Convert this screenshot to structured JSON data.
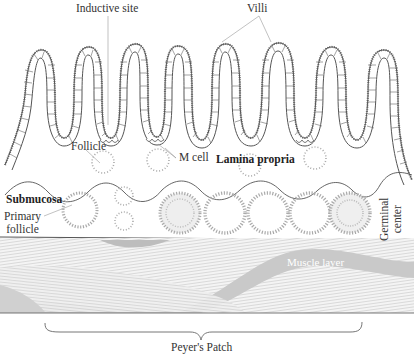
{
  "figure": {
    "title": "Peyer's Patch",
    "labels": {
      "inductive_site": "Inductive site",
      "villi": "Villi",
      "follicle": "Follicle",
      "m_cell": "M cell",
      "lamina_propria": "Lamina propria",
      "submucosa": "Submucosa",
      "primary_follicle_line1": "Primary",
      "primary_follicle_line2": "follicle",
      "germinal_center_line1": "Germinal",
      "germinal_center_line2": "center",
      "muscle_layer": "Muscle layer",
      "peyers_patch": "Peyer's Patch"
    },
    "colors": {
      "outline": "#555555",
      "cell_fill": "#ffffff",
      "follicle_dots": "#aaaaaa",
      "muscle_dark": "#c8c8c8",
      "muscle_light": "#ececec",
      "label_text": "#333333"
    },
    "structure": {
      "villi_count": 8,
      "lamina_propria_follicles": 4,
      "submucosa_follicles": 7
    }
  }
}
